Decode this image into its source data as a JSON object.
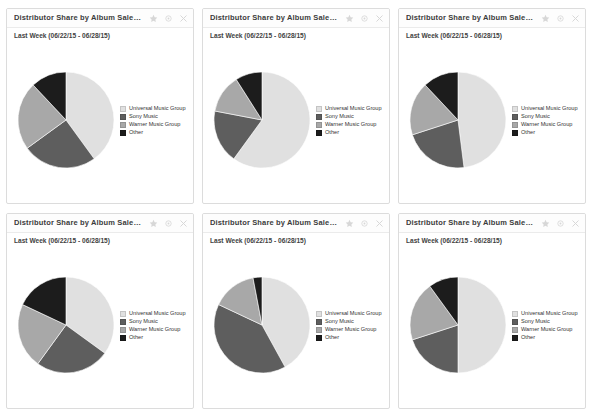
{
  "legend": {
    "entries": [
      {
        "label": "Universal Music Group",
        "color": "#e0e0e0"
      },
      {
        "label": "Sony Music",
        "color": "#5e5e5e"
      },
      {
        "label": "Warner Music Group",
        "color": "#a8a8a8"
      },
      {
        "label": "Other",
        "color": "#1c1c1c"
      }
    ]
  },
  "tools": {
    "favorite": "star-icon",
    "settings": "gear-icon",
    "close": "close-icon"
  },
  "panels": [
    {
      "title": "Distributor Share by Album Sales (Physical)",
      "subtitle": "Last Week (06/22/15 - 06/28/15)"
    },
    {
      "title": "Distributor Share by Album Sales (New)",
      "subtitle": "Last Week (06/22/15 - 06/28/15)"
    },
    {
      "title": "Distributor Share by Album Sales (Current)",
      "subtitle": "Last Week (06/22/15 - 06/28/15)"
    },
    {
      "title": "Distributor Share by Album Sales (Catalog)",
      "subtitle": "Last Week (06/22/15 - 06/28/15)"
    },
    {
      "title": "Distributor Share by Album Sales (Pop)",
      "subtitle": "Last Week (06/22/15 - 06/28/15)"
    },
    {
      "title": "Distributor Share by Album Sales (Rock)",
      "subtitle": "Last Week (06/22/15 - 06/28/15)"
    }
  ],
  "chart_data": [
    {
      "type": "pie",
      "title": "Distributor Share by Album Sales (Physical)",
      "subtitle": "Last Week (06/22/15 - 06/28/15)",
      "categories": [
        "Universal Music Group",
        "Sony Music",
        "Warner Music Group",
        "Other"
      ],
      "values": [
        40,
        25,
        23,
        12
      ],
      "colors": [
        "#e0e0e0",
        "#5e5e5e",
        "#a8a8a8",
        "#1c1c1c"
      ],
      "start_angle": 0,
      "legend_position": "right"
    },
    {
      "type": "pie",
      "title": "Distributor Share by Album Sales (New)",
      "subtitle": "Last Week (06/22/15 - 06/28/15)",
      "categories": [
        "Universal Music Group",
        "Sony Music",
        "Warner Music Group",
        "Other"
      ],
      "values": [
        60,
        18,
        13,
        9
      ],
      "colors": [
        "#e0e0e0",
        "#5e5e5e",
        "#a8a8a8",
        "#1c1c1c"
      ],
      "start_angle": 0,
      "legend_position": "right"
    },
    {
      "type": "pie",
      "title": "Distributor Share by Album Sales (Current)",
      "subtitle": "Last Week (06/22/15 - 06/28/15)",
      "categories": [
        "Universal Music Group",
        "Sony Music",
        "Warner Music Group",
        "Other"
      ],
      "values": [
        48,
        22,
        18,
        12
      ],
      "colors": [
        "#e0e0e0",
        "#5e5e5e",
        "#a8a8a8",
        "#1c1c1c"
      ],
      "start_angle": 0,
      "legend_position": "right"
    },
    {
      "type": "pie",
      "title": "Distributor Share by Album Sales (Catalog)",
      "subtitle": "Last Week (06/22/15 - 06/28/15)",
      "categories": [
        "Universal Music Group",
        "Sony Music",
        "Warner Music Group",
        "Other"
      ],
      "values": [
        35,
        25,
        22,
        18
      ],
      "colors": [
        "#e0e0e0",
        "#5e5e5e",
        "#a8a8a8",
        "#1c1c1c"
      ],
      "start_angle": 0,
      "legend_position": "right"
    },
    {
      "type": "pie",
      "title": "Distributor Share by Album Sales (Pop)",
      "subtitle": "Last Week (06/22/15 - 06/28/15)",
      "categories": [
        "Universal Music Group",
        "Sony Music",
        "Warner Music Group",
        "Other"
      ],
      "values": [
        42,
        40,
        15,
        3
      ],
      "colors": [
        "#e0e0e0",
        "#5e5e5e",
        "#a8a8a8",
        "#1c1c1c"
      ],
      "start_angle": 0,
      "legend_position": "right"
    },
    {
      "type": "pie",
      "title": "Distributor Share by Album Sales (Rock)",
      "subtitle": "Last Week (06/22/15 - 06/28/15)",
      "categories": [
        "Universal Music Group",
        "Sony Music",
        "Warner Music Group",
        "Other"
      ],
      "values": [
        50,
        20,
        20,
        10
      ],
      "colors": [
        "#e0e0e0",
        "#5e5e5e",
        "#a8a8a8",
        "#1c1c1c"
      ],
      "start_angle": 0,
      "legend_position": "right"
    }
  ]
}
